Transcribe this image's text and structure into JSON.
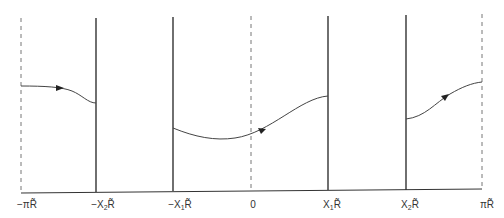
{
  "diagram": {
    "type": "piecewise-wave-path",
    "colors": {
      "line": "#333333",
      "dashed": "#777777",
      "curve": "#444444"
    },
    "axis": {
      "y_left": 193,
      "y_right": 189,
      "x_start": 21,
      "x_end": 482
    },
    "boundaries": [
      {
        "x": 21,
        "style": "dashed",
        "label": "−πR̃"
      },
      {
        "x": 96,
        "style": "solid",
        "label": "−X₂R̃"
      },
      {
        "x": 173,
        "style": "solid",
        "label": "−X₁R̃"
      },
      {
        "x": 251,
        "style": "dashed",
        "label": "0"
      },
      {
        "x": 328,
        "style": "solid",
        "label": "X₁R̃"
      },
      {
        "x": 406,
        "style": "solid",
        "label": "X₂R̃"
      },
      {
        "x": 482,
        "style": "dashed",
        "label": "πR̃"
      }
    ],
    "segments": [
      {
        "from": [
          21,
          86
        ],
        "to": [
          96,
          103
        ],
        "arrow_at": [
          60,
          88
        ]
      },
      {
        "from": [
          173,
          128
        ],
        "to": [
          328,
          96
        ],
        "min": [
          222,
          140
        ],
        "arrow_at": [
          262,
          131
        ]
      },
      {
        "from": [
          406,
          119
        ],
        "to": [
          482,
          82
        ],
        "arrow_at": [
          445,
          96
        ]
      }
    ]
  },
  "labels": {
    "neg_pi": "−πR̃",
    "neg_x2": "−X",
    "neg_x2_sub": "2",
    "neg_x1": "−X",
    "neg_x1_sub": "1",
    "zero": "0",
    "x1": "X",
    "x1_sub": "1",
    "x2": "X",
    "x2_sub": "2",
    "pi": "πR̃",
    "r_tilde": "R̃"
  }
}
